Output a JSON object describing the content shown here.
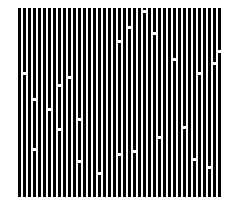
{
  "pattern": {
    "title": "",
    "bar_color": "#000000",
    "background_color": "#ffffff",
    "dash_color": "#ffffff",
    "bar_count": 41,
    "bar_pitch_px": 5,
    "bar_width_px": 3,
    "dashes": [
      {
        "bar": 1,
        "y": 64
      },
      {
        "bar": 3,
        "y": 90
      },
      {
        "bar": 6,
        "y": 100
      },
      {
        "bar": 8,
        "y": 76
      },
      {
        "bar": 10,
        "y": 68
      },
      {
        "bar": 12,
        "y": 110
      },
      {
        "bar": 20,
        "y": 32
      },
      {
        "bar": 22,
        "y": 18
      },
      {
        "bar": 25,
        "y": 2
      },
      {
        "bar": 27,
        "y": 24
      },
      {
        "bar": 31,
        "y": 50
      },
      {
        "bar": 36,
        "y": 64
      },
      {
        "bar": 39,
        "y": 54
      },
      {
        "bar": 40,
        "y": 42
      },
      {
        "bar": 3,
        "y": 140
      },
      {
        "bar": 8,
        "y": 120
      },
      {
        "bar": 12,
        "y": 152
      },
      {
        "bar": 16,
        "y": 164
      },
      {
        "bar": 20,
        "y": 145
      },
      {
        "bar": 23,
        "y": 142
      },
      {
        "bar": 28,
        "y": 128
      },
      {
        "bar": 33,
        "y": 118
      },
      {
        "bar": 35,
        "y": 150
      },
      {
        "bar": 38,
        "y": 158
      }
    ]
  }
}
